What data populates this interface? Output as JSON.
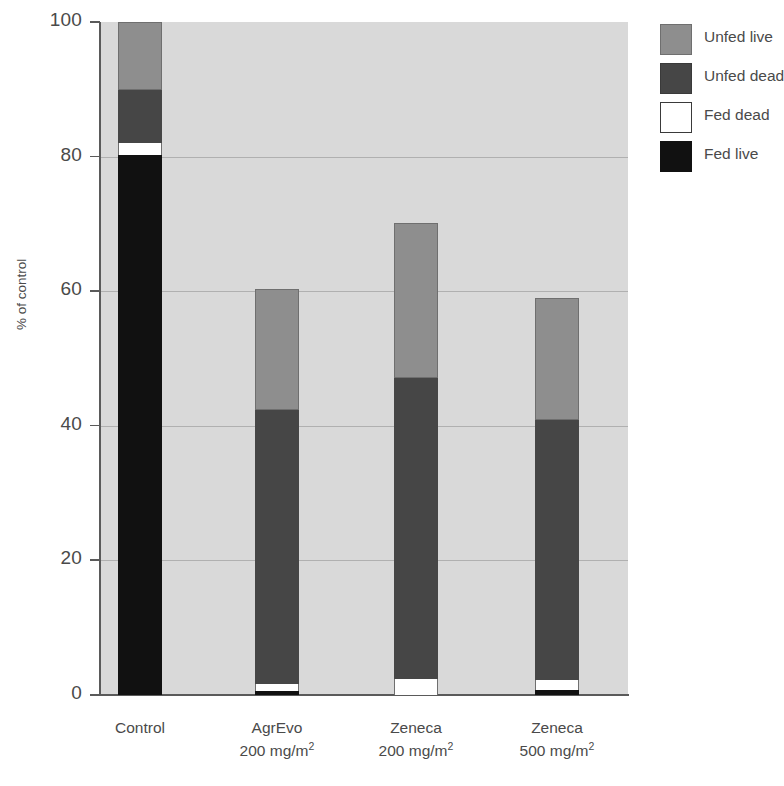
{
  "chart_data": {
    "type": "bar",
    "subtype": "stacked-vertical",
    "title": "",
    "xlabel": "",
    "ylabel": "% of control",
    "ylim": [
      0,
      100
    ],
    "yticks": [
      0,
      20,
      40,
      60,
      80,
      100
    ],
    "ytick_labels": [
      "0",
      "20",
      "40",
      "60",
      "80",
      "100"
    ],
    "grid": "horizontal",
    "legend_position": "right-top",
    "categories": [
      "Control",
      "AgrEvo 200 mg/m2",
      "Zeneca 200 mg/m2",
      "Zeneca 500 mg/m2"
    ],
    "category_lines": [
      {
        "line1": "Control",
        "line2": "",
        "unit_value": "",
        "unit_exp": ""
      },
      {
        "line1": "AgrEvo",
        "line2": "200 mg/m",
        "unit_value": "200 mg/m",
        "unit_exp": "2"
      },
      {
        "line1": "Zeneca",
        "line2": "200 mg/m",
        "unit_value": "200 mg/m",
        "unit_exp": "2"
      },
      {
        "line1": "Zeneca",
        "line2": "500 mg/m",
        "unit_value": "500 mg/m",
        "unit_exp": "2"
      }
    ],
    "series": [
      {
        "name": "Fed live",
        "color": "#111111",
        "values": [
          80.2,
          0.6,
          0.0,
          0.8
        ]
      },
      {
        "name": "Fed dead",
        "color": "#ffffff",
        "values": [
          1.8,
          1.0,
          2.4,
          1.5
        ]
      },
      {
        "name": "Unfed dead",
        "color": "#464646",
        "values": [
          7.9,
          40.7,
          44.7,
          38.6
        ]
      },
      {
        "name": "Unfed live",
        "color": "#8e8e8e",
        "values": [
          10.1,
          18.0,
          23.1,
          18.1
        ]
      }
    ],
    "totals": [
      100.0,
      60.3,
      70.2,
      59.0
    ],
    "segment_tops": [
      {
        "fed_live": 80.2,
        "fed_dead": 82.0,
        "unfed_dead": 89.9,
        "unfed_live": 100.0
      },
      {
        "fed_live": 0.6,
        "fed_dead": 1.6,
        "unfed_dead": 42.3,
        "unfed_live": 60.3
      },
      {
        "fed_live": 0.0,
        "fed_dead": 2.4,
        "unfed_dead": 47.1,
        "unfed_live": 70.2
      },
      {
        "fed_live": 0.8,
        "fed_dead": 2.3,
        "unfed_dead": 40.9,
        "unfed_live": 59.0
      }
    ]
  },
  "legend": {
    "items": [
      {
        "label": "Unfed live",
        "swatch": "unfed-live"
      },
      {
        "label": "Unfed dead",
        "swatch": "unfed-dead"
      },
      {
        "label": "Fed dead",
        "swatch": "fed-dead"
      },
      {
        "label": "Fed live",
        "swatch": "fed-live"
      }
    ]
  },
  "axes": {
    "y_title": "% of control",
    "y_tick_labels": [
      "100",
      "80",
      "60",
      "40",
      "20",
      "0"
    ]
  },
  "colors": {
    "plot_background": "#d9d9d9",
    "gridline": "#b0b0b0",
    "axis": "#5a5a5a",
    "text": "#4a4a4a",
    "unfed_live": "#8e8e8e",
    "unfed_dead": "#464646",
    "fed_dead": "#ffffff",
    "fed_live": "#111111"
  },
  "caption": ""
}
